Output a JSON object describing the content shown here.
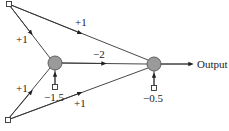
{
  "diagram": {
    "type": "neural-network",
    "colors": {
      "line": "#333333",
      "node_fill": "#9a9a9a",
      "node_stroke": "#555555",
      "background": "#ffffff"
    },
    "nodes": {
      "input_top": {
        "kind": "input",
        "x": 9,
        "y": 4
      },
      "input_bottom": {
        "kind": "input",
        "x": 8,
        "y": 120
      },
      "hidden": {
        "kind": "neuron",
        "x": 55,
        "y": 63,
        "bias": "−1.5"
      },
      "output": {
        "kind": "neuron",
        "x": 154,
        "y": 64,
        "bias": "−0.5"
      }
    },
    "edges": [
      {
        "from": "input_top",
        "to": "hidden",
        "weight": "+1"
      },
      {
        "from": "input_top",
        "to": "output",
        "weight": "+1"
      },
      {
        "from": "input_bottom",
        "to": "hidden",
        "weight": "+1"
      },
      {
        "from": "input_bottom",
        "to": "output",
        "weight": "+1"
      },
      {
        "from": "hidden",
        "to": "output",
        "weight": "−2"
      }
    ],
    "labels": {
      "w_top_hidden": "+1",
      "w_top_output": "+1",
      "w_bottom_hidden": "+1",
      "w_bottom_output": "+1",
      "w_hidden_output": "−2",
      "bias_hidden": "−1.5",
      "bias_output": "−0.5",
      "output": "Output"
    }
  }
}
